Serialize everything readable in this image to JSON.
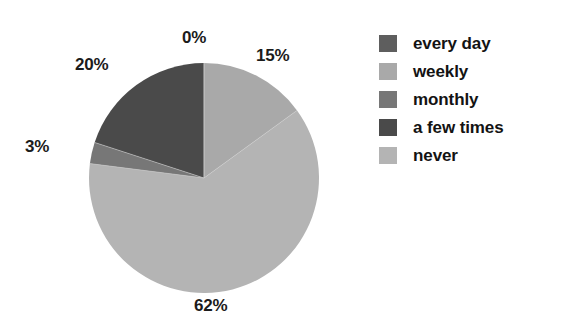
{
  "chart_data": {
    "type": "pie",
    "title": "",
    "categories": [
      "every day",
      "weekly",
      "monthly",
      "a few times",
      "never"
    ],
    "values": [
      0,
      15,
      3,
      20,
      62
    ],
    "value_labels": [
      "0%",
      "15%",
      "3%",
      "20%",
      "62%"
    ],
    "units": "percent",
    "legend_position": "right",
    "grid": false,
    "colors": [
      "#5e5e5e",
      "#a9a9a9",
      "#777777",
      "#4a4a4a",
      "#b4b4b4"
    ],
    "slice_order_clockwise_from_top": [
      "every day",
      "weekly",
      "never",
      "monthly",
      "a few times"
    ],
    "annotations": [
      {
        "text": "0%",
        "category": "every day"
      },
      {
        "text": "15%",
        "category": "weekly"
      },
      {
        "text": "62%",
        "category": "never"
      },
      {
        "text": "3%",
        "category": "monthly"
      },
      {
        "text": "20%",
        "category": "a few times"
      }
    ]
  },
  "labels": {
    "every_day": "0%",
    "weekly": "15%",
    "monthly": "3%",
    "a_few_times": "20%",
    "never": "62%"
  },
  "legend": {
    "items": [
      {
        "label": "every day",
        "color": "#5e5e5e"
      },
      {
        "label": "weekly",
        "color": "#a9a9a9"
      },
      {
        "label": "monthly",
        "color": "#777777"
      },
      {
        "label": "a few times",
        "color": "#4a4a4a"
      },
      {
        "label": "never",
        "color": "#b4b4b4"
      }
    ]
  },
  "geometry": {
    "center_x": 116,
    "center_y": 116,
    "radius": 115
  }
}
